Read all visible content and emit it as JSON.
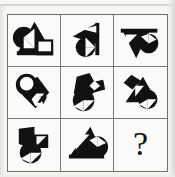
{
  "puzzle": {
    "type": "raven-progressive-matrices",
    "title": "",
    "grid_rows": 3,
    "grid_cols": 3,
    "missing_cell_index": 9,
    "missing_marker": "?",
    "colors": {
      "ink": "#111111",
      "paper": "#fbfaf8",
      "grid_line": "#7a7a7a",
      "page_background": "#f7f6f3"
    },
    "cells": [
      {
        "index": 1,
        "position": "row1-col1",
        "name": "cell-r1c1",
        "description": "Black circle split by a white diagonal wedge on the left, a large black triangle pointing up, and a white square with black outline at lower right.",
        "shapes": [
          "circle-half-split",
          "triangle-up",
          "square-outline"
        ]
      },
      {
        "index": 2,
        "position": "row1-col2",
        "name": "cell-r1c2",
        "description": "Black triangle pointing left with a white triangular notch, and a black circle at lower left split by a white wedge; vertical black bar at right.",
        "shapes": [
          "triangle-left",
          "circle-half-split",
          "vertical-bar"
        ]
      },
      {
        "index": 3,
        "position": "row1-col3",
        "name": "cell-r1c3",
        "description": "Black triangle pointing down with a white triangular notch at upper left, and a black circle at the right split by a white wedge; horizontal black bar across the top.",
        "shapes": [
          "triangle-down",
          "circle-half-split",
          "horizontal-bar"
        ]
      },
      {
        "index": 4,
        "position": "row2-col1",
        "name": "cell-r2c1",
        "description": "Black circle at upper left containing a white circle, with a black triangle pointing down-right and a white zig-zag notch.",
        "shapes": [
          "circle-inner-white",
          "triangle-down-right",
          "notch"
        ]
      },
      {
        "index": 5,
        "position": "row2-col2",
        "name": "cell-r2c2",
        "description": "Black angular arrow shape at upper right with a white diamond notch, and a black circle at lower left split by a white wedge.",
        "shapes": [
          "arrow-block",
          "diamond-notch",
          "circle-half-split"
        ]
      },
      {
        "index": 6,
        "position": "row2-col3",
        "name": "cell-r2c3",
        "description": "Black diamond at upper left, a black triangle pointing down-right, and a black circle at lower right split by a white wedge.",
        "shapes": [
          "diamond",
          "triangle-down-right",
          "circle-half-split"
        ]
      },
      {
        "index": 7,
        "position": "row3-col1",
        "name": "cell-r3c1",
        "description": "Black arrow-like block at upper left with a white triangular notch, and a black circle at lower left split by a white wedge.",
        "shapes": [
          "arrow-block",
          "triangle-notch",
          "circle-half-split"
        ]
      },
      {
        "index": 8,
        "position": "row3-col2",
        "name": "cell-r3c2",
        "description": "Black triangle pointing up-right with a white triangular notch, and a black circle at the right split by a white wedge.",
        "shapes": [
          "triangle-up-right",
          "triangle-notch",
          "circle-half-split"
        ]
      },
      {
        "index": 9,
        "position": "row3-col3",
        "name": "cell-r3c3-answer",
        "description": "Empty answer cell containing a question mark.",
        "shapes": [
          "question-mark"
        ]
      }
    ]
  }
}
